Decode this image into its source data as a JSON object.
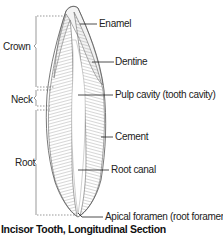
{
  "figure": {
    "caption": "Incisor Tooth, Longitudinal Section",
    "regions": {
      "crown": "Crown",
      "neck": "Neck",
      "root": "Root"
    },
    "labels": {
      "enamel": "Enamel",
      "dentine": "Dentine",
      "pulp_cavity": "Pulp cavity (tooth cavity)",
      "cement": "Cement",
      "root_canal": "Root canal",
      "apical_foramen": "Apical foramen (root foramen)"
    },
    "colors": {
      "line": "#333333",
      "bracket": "#555555",
      "tooth_fill": "#e8e8e8",
      "hatch": "#8a8a8a"
    }
  }
}
